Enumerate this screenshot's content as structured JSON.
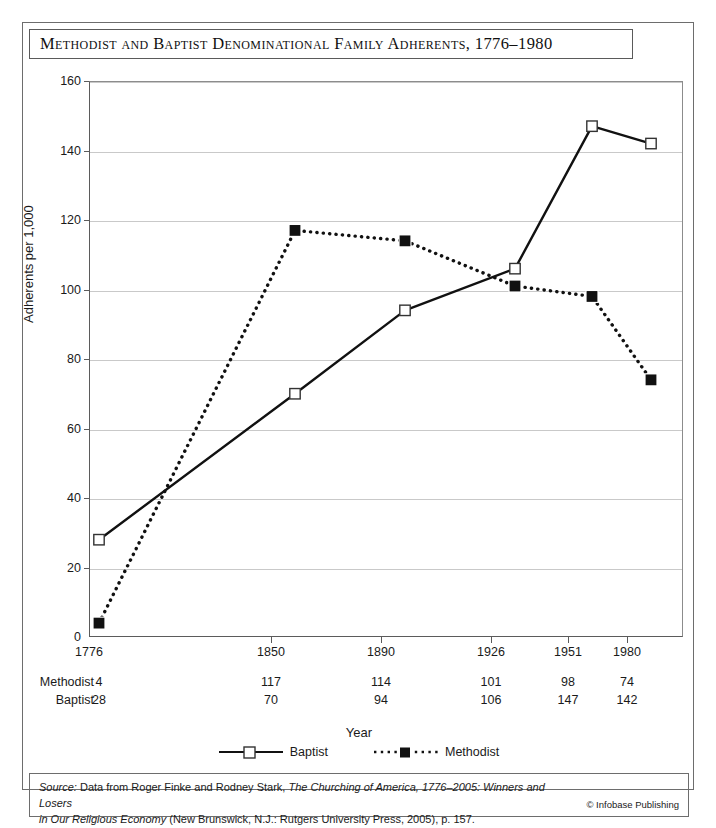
{
  "title": "Methodist and Baptist Denominational Family Adherents, 1776–1980",
  "axes": {
    "x_title": "Year",
    "y_title": "Adherents per 1,000",
    "y_ticks": [
      "0",
      "20",
      "40",
      "60",
      "80",
      "100",
      "120",
      "140",
      "160"
    ],
    "x_ticks": [
      "1776",
      "1850",
      "1890",
      "1926",
      "1951",
      "1980"
    ]
  },
  "legend": [
    {
      "label": "Baptist",
      "marker": "open-square-marker",
      "line": "solid"
    },
    {
      "label": "Methodist",
      "marker": "filled-square-marker",
      "line": "dotted"
    }
  ],
  "table": {
    "rows": [
      {
        "label": "Methodist",
        "values": [
          "4",
          "117",
          "114",
          "101",
          "98",
          "74"
        ]
      },
      {
        "label": "Baptist",
        "values": [
          "28",
          "70",
          "94",
          "106",
          "147",
          "142"
        ]
      }
    ]
  },
  "source": {
    "prefix": "Source:",
    "line1_a": " Data from Roger Finke and Rodney Stark, ",
    "line1_b": "The Churching of America, 1776–2005: Winners and Losers",
    "line2_a": "in Our Religious Economy",
    "line2_b": " (New Brunswick, N.J.: Rutgers University Press, 2005), p. 157.",
    "copyright": "© Infobase Publishing"
  },
  "colors": {
    "line": "#111111",
    "grid": "#c9c9c9",
    "axis": "#5b5b5b",
    "frame": "#6d6d6d",
    "text": "#1a1a1a",
    "background": "#ffffff"
  },
  "chart_data": {
    "type": "line",
    "title": "Methodist and Baptist Denominational Family Adherents, 1776–1980",
    "xlabel": "Year",
    "ylabel": "Adherents per 1,000",
    "categories": [
      "1776",
      "1850",
      "1890",
      "1926",
      "1951",
      "1980"
    ],
    "x_positions_px": [
      98,
      294,
      404,
      514,
      591,
      650
    ],
    "ylim": [
      0,
      160
    ],
    "ytick_step": 20,
    "grid": "horizontal",
    "legend_position": "bottom-center",
    "series": [
      {
        "name": "Baptist",
        "values": [
          28,
          70,
          94,
          106,
          147,
          142
        ],
        "style": "solid",
        "marker": "open-square"
      },
      {
        "name": "Methodist",
        "values": [
          4,
          117,
          114,
          101,
          98,
          74
        ],
        "style": "dotted",
        "marker": "filled-square"
      }
    ]
  }
}
